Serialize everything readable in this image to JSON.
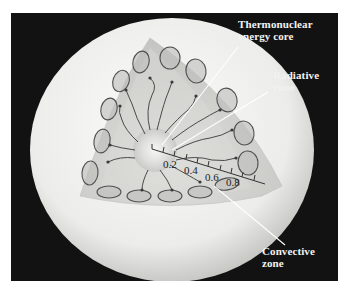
{
  "diagram": {
    "type": "sun-interior-cutaway",
    "labels": {
      "core": [
        "Thermonuclear",
        "energy core"
      ],
      "radiative": [
        "Radiative",
        "zone"
      ],
      "convective": [
        "Convective",
        "zone"
      ]
    },
    "scale_ticks": [
      "0.2",
      "0.4",
      "0.6",
      "0.8"
    ],
    "colors": {
      "background": "#121212",
      "sphere_light": "#f7f7f5",
      "sphere_shadow": "#c9c9c6",
      "convective_zone": "#b9b9b6",
      "radiative_zone": "#d6d6d3",
      "core": "#ebebea",
      "loop_stroke": "#555555",
      "leader_line": "#ffffff",
      "label_text": "#f2f2f2"
    }
  }
}
